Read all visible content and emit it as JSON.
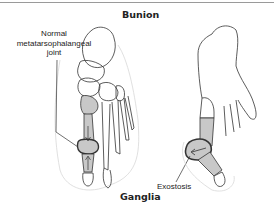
{
  "figure": {
    "title_top": "Bunion",
    "title_bottom": "Ganglia",
    "labels": {
      "normal_line1": "Normal",
      "normal_line2": "metatarsophalangeal",
      "normal_line3": "joint",
      "exostosis": "Exostosis"
    },
    "colors": {
      "bone_shade": "#c8c8c8",
      "outline": "#333333",
      "skin_outline": "#d8d8d8"
    }
  }
}
